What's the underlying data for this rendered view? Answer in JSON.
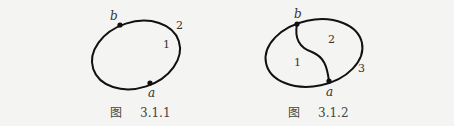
{
  "figures": [
    {
      "id": "3.1.1",
      "caption_prefix": "图",
      "caption_number": "3.1.1",
      "vertices": [
        {
          "name": "b",
          "x": 120,
          "y": 25
        },
        {
          "name": "a",
          "x": 150,
          "y": 83
        }
      ],
      "edges": [
        "outer-ellipse"
      ],
      "edge_labels": [
        {
          "text": "2",
          "x": 176,
          "y": 29
        },
        {
          "text": "1",
          "x": 163,
          "y": 48
        }
      ]
    },
    {
      "id": "3.1.2",
      "caption_prefix": "图",
      "caption_number": "3.1.2",
      "vertices": [
        {
          "name": "b",
          "x": 297,
          "y": 24
        },
        {
          "name": "a",
          "x": 329,
          "y": 81
        }
      ],
      "edges": [
        "outer-ellipse",
        "inner-s-curve"
      ],
      "edge_labels": [
        {
          "text": "2",
          "x": 328,
          "y": 43
        },
        {
          "text": "1",
          "x": 294,
          "y": 66
        },
        {
          "text": "3",
          "x": 358,
          "y": 72
        }
      ]
    }
  ],
  "colors": {
    "background": "#f4f4f2",
    "stroke": "#111111",
    "text": "#333333"
  }
}
